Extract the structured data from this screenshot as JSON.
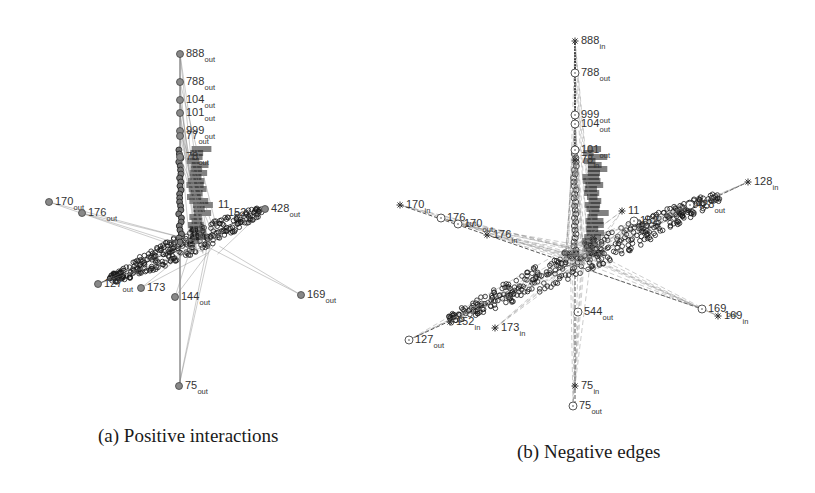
{
  "figure": {
    "panels": [
      {
        "id": "a",
        "caption": "(a) Positive interactions",
        "label_subscript": "out",
        "hub": [
          205,
          245
        ],
        "spine": {
          "x": 180,
          "y_top": 54,
          "y_bottom": 386
        },
        "axes": [
          {
            "from": [
              98,
              284
            ],
            "to": [
              265,
              209
            ]
          },
          {
            "from": [
              180,
              54
            ],
            "to": [
              180,
              386
            ]
          }
        ],
        "cluster": {
          "from": [
            110,
            280
          ],
          "to": [
            262,
            210
          ],
          "width": 22
        },
        "nodes": [
          {
            "id": "888",
            "sub": "out",
            "x": 180,
            "y": 54,
            "marker": "filled-circle"
          },
          {
            "id": "788",
            "sub": "out",
            "x": 180,
            "y": 82,
            "marker": "filled-circle"
          },
          {
            "id": "104",
            "sub": "out",
            "x": 180,
            "y": 100,
            "marker": "filled-circle"
          },
          {
            "id": "101",
            "sub": "out",
            "x": 180,
            "y": 113,
            "marker": "filled-circle"
          },
          {
            "id": "999",
            "sub": "out",
            "x": 180,
            "y": 131,
            "marker": "filled-circle"
          },
          {
            "id": "77",
            "sub": "out",
            "x": 180,
            "y": 136,
            "marker": "filled-circle"
          },
          {
            "id": "78",
            "sub": "out",
            "x": 180,
            "y": 157,
            "marker": "filled-circle"
          },
          {
            "id": "170",
            "sub": "out",
            "x": 49,
            "y": 202,
            "marker": "filled-circle"
          },
          {
            "id": "176",
            "sub": "out",
            "x": 82,
            "y": 213,
            "marker": "filled-circle"
          },
          {
            "id": "428",
            "sub": "out",
            "x": 265,
            "y": 209,
            "marker": "filled-circle"
          },
          {
            "id": "11",
            "sub": "",
            "x": 212,
            "y": 205,
            "marker": "none"
          },
          {
            "id": "152",
            "sub": "",
            "x": 222,
            "y": 213,
            "marker": "none"
          },
          {
            "id": "127",
            "sub": "out",
            "x": 98,
            "y": 284,
            "marker": "filled-circle"
          },
          {
            "id": "173",
            "sub": "",
            "x": 141,
            "y": 288,
            "marker": "filled-circle"
          },
          {
            "id": "144",
            "sub": "out",
            "x": 175,
            "y": 297,
            "marker": "filled-circle"
          },
          {
            "id": "169",
            "sub": "out",
            "x": 301,
            "y": 295,
            "marker": "filled-circle"
          },
          {
            "id": "75",
            "sub": "out",
            "x": 179,
            "y": 386,
            "marker": "filled-circle"
          }
        ]
      },
      {
        "id": "b",
        "caption": "(b) Negative edges",
        "hub": [
          580,
          255
        ],
        "spine": {
          "x": 575,
          "y_top": 41,
          "y_bottom": 406
        },
        "axes": [
          {
            "from": [
              400,
              205
            ],
            "to": [
              702,
              309
            ]
          },
          {
            "from": [
              409,
              340
            ],
            "to": [
              748,
              182
            ]
          },
          {
            "from": [
              575,
              41
            ],
            "to": [
              575,
              406
            ]
          }
        ],
        "cluster": {
          "from": [
            450,
            320
          ],
          "to": [
            720,
            195
          ],
          "width": 26
        },
        "nodes": [
          {
            "id": "888",
            "sub": "in",
            "x": 575,
            "y": 41,
            "marker": "star"
          },
          {
            "id": "788",
            "sub": "out",
            "x": 575,
            "y": 73,
            "marker": "open-circle"
          },
          {
            "id": "999",
            "sub": "out",
            "x": 575,
            "y": 115,
            "marker": "open-circle"
          },
          {
            "id": "104",
            "sub": "out",
            "x": 575,
            "y": 124,
            "marker": "open-circle"
          },
          {
            "id": "101",
            "sub": "out",
            "x": 575,
            "y": 150,
            "marker": "open-circle"
          },
          {
            "id": "78",
            "sub": "in",
            "x": 575,
            "y": 160,
            "marker": "star"
          },
          {
            "id": "170",
            "sub": "in",
            "x": 400,
            "y": 205,
            "marker": "star"
          },
          {
            "id": "176",
            "sub": "out",
            "x": 441,
            "y": 218,
            "marker": "open-circle"
          },
          {
            "id": "170",
            "sub": "out",
            "x": 458,
            "y": 224,
            "marker": "open-circle"
          },
          {
            "id": "176",
            "sub": "in",
            "x": 487,
            "y": 235,
            "marker": "star"
          },
          {
            "id": "11",
            "sub": "",
            "x": 622,
            "y": 211,
            "marker": "star"
          },
          {
            "id": "152",
            "sub": "",
            "x": 634,
            "y": 221,
            "marker": "open-circle"
          },
          {
            "id": "428",
            "sub": "out",
            "x": 690,
            "y": 205,
            "marker": "open-circle"
          },
          {
            "id": "128",
            "sub": "in",
            "x": 748,
            "y": 182,
            "marker": "star"
          },
          {
            "id": "127",
            "sub": "out",
            "x": 409,
            "y": 340,
            "marker": "open-circle"
          },
          {
            "id": "152",
            "sub": "in",
            "x": 450,
            "y": 322,
            "marker": "star"
          },
          {
            "id": "173",
            "sub": "in",
            "x": 495,
            "y": 328,
            "marker": "star"
          },
          {
            "id": "544",
            "sub": "out",
            "x": 578,
            "y": 312,
            "marker": "open-circle"
          },
          {
            "id": "169",
            "sub": "out",
            "x": 702,
            "y": 309,
            "marker": "open-circle"
          },
          {
            "id": "169",
            "sub": "in",
            "x": 718,
            "y": 316,
            "marker": "star"
          },
          {
            "id": "75",
            "sub": "in",
            "x": 575,
            "y": 386,
            "marker": "star"
          },
          {
            "id": "75",
            "sub": "out",
            "x": 573,
            "y": 406,
            "marker": "open-circle"
          }
        ]
      }
    ]
  },
  "colors": {
    "ink": "#333333",
    "dense": "#1a1a1a",
    "edge": "#555555",
    "background": "#ffffff"
  }
}
